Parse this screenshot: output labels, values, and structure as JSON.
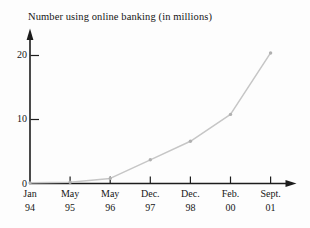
{
  "page": {
    "background_color": "#fdfdfd"
  },
  "chart_data": {
    "type": "line",
    "title": "Number using online banking (in millions)",
    "xlabel": "",
    "ylabel": "",
    "categories": [
      {
        "month": "Jan",
        "year": "94"
      },
      {
        "month": "May",
        "year": "95"
      },
      {
        "month": "May",
        "year": "96"
      },
      {
        "month": "Dec.",
        "year": "97"
      },
      {
        "month": "Dec.",
        "year": "98"
      },
      {
        "month": "Feb.",
        "year": "00"
      },
      {
        "month": "Sept.",
        "year": "01"
      }
    ],
    "values": [
      0.1,
      0.2,
      0.8,
      3.7,
      6.6,
      10.8,
      20.4
    ],
    "yticks": [
      0,
      10,
      20
    ],
    "ylim": [
      0,
      22
    ],
    "grid": false,
    "legend": false,
    "line_color": "#c6c6c6",
    "marker_color": "#b0b0b0",
    "axis_color": "#1c1c1c",
    "text_color": "#161616"
  }
}
